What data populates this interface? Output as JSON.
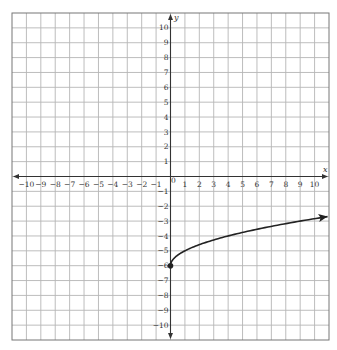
{
  "chart_data": {
    "type": "line",
    "title": "",
    "xlabel": "x",
    "ylabel": "y",
    "xlim": [
      -11,
      11
    ],
    "ylim": [
      -11,
      11
    ],
    "grid": true,
    "x_ticks": [
      -10,
      -9,
      -8,
      -7,
      -6,
      -5,
      -4,
      -3,
      -2,
      -1,
      0,
      1,
      2,
      3,
      4,
      5,
      6,
      7,
      8,
      9,
      10
    ],
    "y_ticks": [
      10,
      9,
      8,
      7,
      6,
      5,
      4,
      3,
      2,
      1,
      -1,
      -2,
      -3,
      -4,
      -5,
      -6,
      -7,
      -8,
      -9,
      -10
    ],
    "series": [
      {
        "name": "f(x) = sqrt(x) - 6",
        "start_point": {
          "x": 0,
          "y": -6,
          "closed": true
        },
        "end_arrow": true,
        "x": [
          0,
          0.25,
          1,
          2,
          4,
          6,
          9,
          10.9
        ],
        "y": [
          -6,
          -5.5,
          -5,
          -4.59,
          -4,
          -3.55,
          -3,
          -2.7
        ]
      }
    ],
    "colors": {
      "grid": "#b5b5b5",
      "axis": "#333333",
      "curve": "#222222",
      "border": "#777777"
    }
  }
}
